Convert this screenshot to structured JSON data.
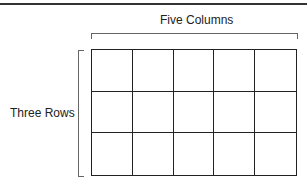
{
  "labels": {
    "columns": "Five Columns",
    "rows": "Three Rows"
  },
  "grid": {
    "rows": 3,
    "columns": 5
  }
}
